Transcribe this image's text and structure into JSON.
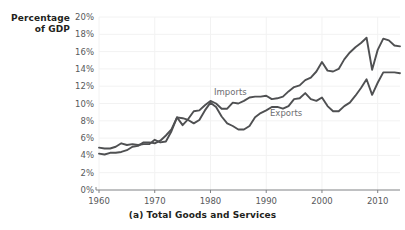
{
  "chart_data": {
    "type": "line",
    "title": "",
    "caption": "(a) Total Goods and Services",
    "ylabel_line1": "Percentage",
    "ylabel_line2": "of GDP",
    "xlabel": "",
    "grid": true,
    "legend_position": "inline-annotation",
    "xlim": [
      1960,
      2014
    ],
    "ylim": [
      0,
      20
    ],
    "ytick_labels": [
      "20%",
      "18%",
      "16%",
      "14%",
      "12%",
      "10%",
      "8%",
      "6%",
      "4%",
      "2%",
      "0%"
    ],
    "ytick_values": [
      20,
      18,
      16,
      14,
      12,
      10,
      8,
      6,
      4,
      2,
      0
    ],
    "xtick_labels": [
      "1960",
      "1970",
      "1980",
      "1990",
      "2000",
      "2010"
    ],
    "xtick_values": [
      1960,
      1970,
      1980,
      1990,
      2000,
      2010
    ],
    "line_color": "#4f5052",
    "grid_color": "#f2f2f2",
    "axis_color": "#808285",
    "x": [
      1960,
      1961,
      1962,
      1963,
      1964,
      1965,
      1966,
      1967,
      1968,
      1969,
      1970,
      1971,
      1972,
      1973,
      1974,
      1975,
      1976,
      1977,
      1978,
      1979,
      1980,
      1981,
      1982,
      1983,
      1984,
      1985,
      1986,
      1987,
      1988,
      1989,
      1990,
      1991,
      1992,
      1993,
      1994,
      1995,
      1996,
      1997,
      1998,
      1999,
      2000,
      2001,
      2002,
      2003,
      2004,
      2005,
      2006,
      2007,
      2008,
      2009,
      2010,
      2011,
      2012,
      2013,
      2014
    ],
    "series": [
      {
        "name": "Imports",
        "label": "Imports",
        "values": [
          4.2,
          4.1,
          4.3,
          4.3,
          4.4,
          4.6,
          5.0,
          5.1,
          5.5,
          5.5,
          5.4,
          5.7,
          6.3,
          7.0,
          8.4,
          7.5,
          8.2,
          9.1,
          9.2,
          9.8,
          10.3,
          10.0,
          9.4,
          9.4,
          10.1,
          10.0,
          10.3,
          10.7,
          10.8,
          10.8,
          10.9,
          10.5,
          10.6,
          10.8,
          11.4,
          11.9,
          12.1,
          12.7,
          13.0,
          13.7,
          14.8,
          13.8,
          13.7,
          14.0,
          15.1,
          15.9,
          16.5,
          17.0,
          17.6,
          13.9,
          16.2,
          17.5,
          17.3,
          16.7,
          16.6
        ]
      },
      {
        "name": "Exports",
        "label": "Exports",
        "values": [
          4.9,
          4.8,
          4.8,
          5.0,
          5.4,
          5.2,
          5.3,
          5.2,
          5.3,
          5.3,
          5.8,
          5.5,
          5.6,
          6.8,
          8.4,
          8.3,
          8.1,
          7.7,
          8.1,
          9.2,
          10.1,
          9.6,
          8.5,
          7.7,
          7.4,
          7.0,
          7.0,
          7.4,
          8.4,
          8.9,
          9.2,
          9.6,
          9.6,
          9.4,
          9.7,
          10.5,
          10.6,
          11.2,
          10.5,
          10.3,
          10.7,
          9.7,
          9.1,
          9.1,
          9.7,
          10.1,
          10.9,
          11.8,
          12.8,
          11.0,
          12.4,
          13.6,
          13.6,
          13.6,
          13.5
        ]
      }
    ]
  }
}
